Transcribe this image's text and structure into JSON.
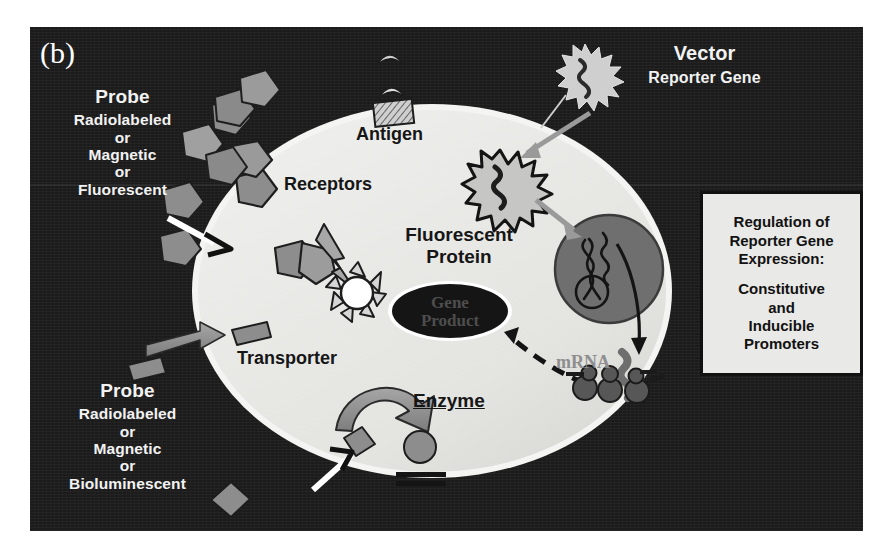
{
  "figure": {
    "panel_label": "(b)",
    "background_color": "#1b1b1b",
    "cell_color": "#e8e8e6",
    "accent_gray": "#8c8c8c",
    "nucleus_color": "#6f6f6f"
  },
  "probe_top": {
    "header": "Probe",
    "line1": "Radiolabeled",
    "line2": "or",
    "line3": "Magnetic",
    "line4": "or",
    "line5": "Fluorescent"
  },
  "probe_bottom": {
    "header": "Probe",
    "line1": "Radiolabeled",
    "line2": "or",
    "line3": "Magnetic",
    "line4": "or",
    "line5": "Bioluminescent"
  },
  "vector": {
    "header": "Vector",
    "subtitle": "Reporter Gene"
  },
  "cell_labels": {
    "antigen": "Antigen",
    "receptors": "Receptors",
    "fluorescent_protein_line1": "Fluorescent",
    "fluorescent_protein_line2": "Protein",
    "transporter": "Transporter",
    "enzyme": "Enzyme",
    "gene_product_line1": "Gene",
    "gene_product_line2": "Product",
    "mrna": "mRNA"
  },
  "info_box": {
    "title_line1": "Regulation of",
    "title_line2": "Reporter Gene",
    "title_line3": "Expression:",
    "body_line1": "Constitutive",
    "body_line2": "and",
    "body_line3": "Inducible",
    "body_line4": "Promoters"
  },
  "icons": {
    "cell": "cell-membrane-ellipse",
    "nucleus": "nucleus-circle",
    "dna": "dna-strand",
    "vector_outside": "starburst-vector-icon",
    "vector_inside": "starburst-vector-icon",
    "antigen": "antigen-icon",
    "receptor": "receptor-pentagon-icon",
    "probe": "probe-pentagon-icon",
    "fluorescent_protein": "fluorescent-burst-icon",
    "gene_product": "gene-product-ellipse",
    "ribosome": "ribosome-icon",
    "mrna_strand": "mrna-squiggle-icon",
    "enzyme_arrow": "enzyme-curved-arrow-icon",
    "substrate": "substrate-diamond-icon",
    "product": "product-circle-icon",
    "transporter_arrow": "transporter-arrow-icon",
    "probe_pointer": "probe-pointer-arrow-icon",
    "vector_entry_arrow": "vector-entry-arrow-icon",
    "transcription_arrow": "transcription-arrow-icon",
    "translation_arrow": "translation-dashed-arrow-icon"
  }
}
